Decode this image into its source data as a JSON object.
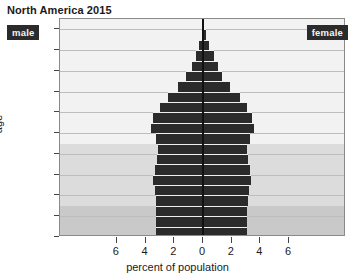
{
  "chart_data": {
    "type": "bar",
    "subtype": "population-pyramid",
    "title": "North America 2015",
    "xlabel": "percent of population",
    "ylabel": "age",
    "xlim": [
      -7.5,
      7.5
    ],
    "ylim": [
      0,
      105
    ],
    "grid": true,
    "legend_position": "inside-top-corners",
    "xtick_labels": [
      "6",
      "4",
      "2",
      "0",
      "2",
      "4",
      "6"
    ],
    "xtick_values": [
      -6,
      -4,
      -2,
      0,
      2,
      4,
      6
    ],
    "ytick_labels": [
      "0",
      "10",
      "20",
      "30",
      "40",
      "50",
      "60",
      "70",
      "80",
      "90",
      "100+"
    ],
    "ytick_values": [
      0,
      10,
      20,
      30,
      40,
      50,
      60,
      70,
      80,
      90,
      100
    ],
    "series": [
      {
        "name": "male",
        "side": "left",
        "color": "#2b2b2b"
      },
      {
        "name": "female",
        "side": "right",
        "color": "#2b2b2b"
      }
    ],
    "categories": [
      "0-4",
      "5-9",
      "10-14",
      "15-19",
      "20-24",
      "25-29",
      "30-34",
      "35-39",
      "40-44",
      "45-49",
      "50-54",
      "55-59",
      "60-64",
      "65-69",
      "70-74",
      "75-79",
      "80-84",
      "85-89",
      "90-94",
      "95-99",
      "100+"
    ],
    "age_starts": [
      0,
      5,
      10,
      15,
      20,
      25,
      30,
      35,
      40,
      45,
      50,
      55,
      60,
      65,
      70,
      75,
      80,
      85,
      90,
      95,
      100
    ],
    "male_values": [
      3.25,
      3.25,
      3.25,
      3.3,
      3.35,
      3.5,
      3.35,
      3.2,
      3.15,
      3.3,
      3.65,
      3.45,
      3.0,
      2.45,
      1.75,
      1.15,
      0.8,
      0.5,
      0.25,
      0.1,
      0.03
    ],
    "female_values": [
      3.1,
      3.1,
      3.1,
      3.15,
      3.2,
      3.35,
      3.25,
      3.15,
      3.1,
      3.25,
      3.55,
      3.4,
      3.05,
      2.55,
      1.9,
      1.35,
      1.05,
      0.75,
      0.42,
      0.18,
      0.05
    ],
    "shading_bands": [
      {
        "label": "dependent-youth",
        "age_from": 0,
        "age_to": 15,
        "color": "#c9c9c9"
      },
      {
        "label": "working-age",
        "age_from": 15,
        "age_to": 45,
        "color": "#dcdcdc"
      },
      {
        "label": "older-adults",
        "age_from": 45,
        "age_to": 105,
        "color": "#f2f2f2"
      }
    ]
  },
  "labels": {
    "title": "North America 2015",
    "male": "male",
    "female": "female",
    "xaxis": "percent of population",
    "yaxis": "age"
  }
}
